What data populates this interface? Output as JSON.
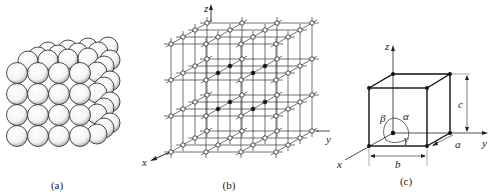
{
  "figure": {
    "panels": [
      {
        "id": "a",
        "caption": "(a)",
        "description": "close-packed spheres arranged in a cubic block"
      },
      {
        "id": "b",
        "caption": "(b)",
        "description": "three-dimensional space lattice",
        "axes": {
          "x": "x",
          "y": "y",
          "z": "z"
        }
      },
      {
        "id": "c",
        "caption": "(c)",
        "description": "unit cell with lattice parameters",
        "axes": {
          "x": "x",
          "y": "y",
          "z": "z"
        },
        "edges": {
          "a": "a",
          "b": "b",
          "c": "c"
        },
        "angles": {
          "alpha": "α",
          "beta": "β",
          "gamma": "γ"
        }
      }
    ]
  },
  "colors": {
    "line": "#222222",
    "sphere_fill": "#ffffff",
    "node_open": "#ffffff",
    "node_filled": "#111111"
  }
}
